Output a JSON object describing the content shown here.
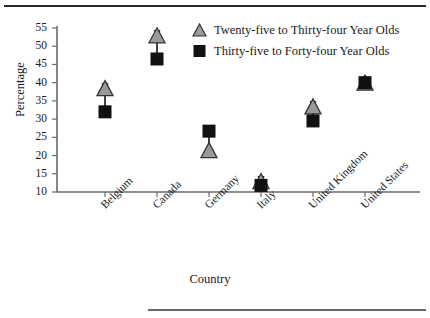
{
  "chart_data": {
    "type": "scatter",
    "title": "",
    "xlabel": "Country",
    "ylabel": "Percentage",
    "categories": [
      "Belgium",
      "Canada",
      "Germany",
      "Italy",
      "United Kingdom",
      "United States"
    ],
    "ylim": [
      10,
      55
    ],
    "yticks": [
      10,
      15,
      20,
      25,
      30,
      35,
      40,
      45,
      50,
      55
    ],
    "grid": false,
    "legend_position": "top-right",
    "series": [
      {
        "name": "Twenty-five to Thirty-four Year Olds",
        "marker": "triangle",
        "color": "#9a9a9a",
        "edge_color": "#333333",
        "values": [
          38.5,
          53.0,
          21.5,
          13.0,
          33.5,
          40.0
        ]
      },
      {
        "name": "Thirty-five to Forty-four Year Olds",
        "marker": "square",
        "color": "#111111",
        "edge_color": "#111111",
        "values": [
          32.0,
          46.5,
          26.7,
          11.8,
          29.5,
          40.0
        ]
      }
    ],
    "connectors": [
      {
        "category": "Belgium",
        "from": 32.0,
        "to": 38.5,
        "direction": "up"
      },
      {
        "category": "Canada",
        "from": 46.5,
        "to": 53.0,
        "direction": "up"
      },
      {
        "category": "Germany",
        "from": 26.7,
        "to": 21.5,
        "direction": "down"
      },
      {
        "category": "Italy",
        "from": 11.8,
        "to": 13.0,
        "direction": "up"
      },
      {
        "category": "United Kingdom",
        "from": 29.5,
        "to": 33.5,
        "direction": "up"
      },
      {
        "category": "United States",
        "from": 40.0,
        "to": 40.0,
        "direction": "none"
      }
    ]
  },
  "axes": {
    "y_title": "Percentage",
    "x_title": "Country",
    "y_tick_labels": [
      "55",
      "50",
      "45",
      "40",
      "35",
      "30",
      "25",
      "20",
      "15",
      "10"
    ],
    "x_tick_labels": [
      "Belgium",
      "Canada",
      "Germany",
      "Italy",
      "United Kingdom",
      "United States"
    ]
  },
  "legend": {
    "items": [
      {
        "label": "Twenty-five to Thirty-four Year Olds",
        "marker": "triangle-icon"
      },
      {
        "label": "Thirty-five to Forty-four Year Olds",
        "marker": "square-icon"
      }
    ]
  },
  "colors": {
    "triangle_fill": "#9a9a9a",
    "triangle_edge": "#333333",
    "square_fill": "#111111",
    "axis": "#6a6a6a",
    "rule": "#2b2b2b"
  }
}
